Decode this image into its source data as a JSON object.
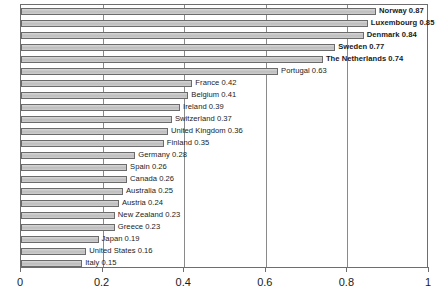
{
  "chart_data": {
    "type": "bar",
    "orientation": "horizontal",
    "title": "",
    "xlabel": "",
    "ylabel": "",
    "xlim": [
      0,
      1
    ],
    "grid": true,
    "legend": false,
    "xticks": [
      "0",
      "0.2",
      "0.4",
      "0.6",
      "0.8",
      "1"
    ],
    "xtick_values": [
      0,
      0.2,
      0.4,
      0.6,
      0.8,
      1
    ],
    "categories": [
      "Norway",
      "Luxembourg",
      "Denmark",
      "Sweden",
      "The Netherlands",
      "Portugal",
      "France",
      "Belgium",
      "Ireland",
      "Switzerland",
      "United Kingdom",
      "Finland",
      "Germany",
      "Spain",
      "Canada",
      "Australia",
      "Austria",
      "New Zealand",
      "Greece",
      "Japan",
      "United States",
      "Italy"
    ],
    "values": [
      0.87,
      0.85,
      0.84,
      0.77,
      0.74,
      0.63,
      0.42,
      0.41,
      0.39,
      0.37,
      0.36,
      0.35,
      0.28,
      0.26,
      0.26,
      0.25,
      0.24,
      0.23,
      0.23,
      0.19,
      0.16,
      0.15
    ],
    "data_labels": [
      "Norway 0.87",
      "Luxembourg 0.85",
      "Denmark 0.84",
      "Sweden 0.77",
      "The Netherlands 0.74",
      "Portugal 0.63",
      "France 0.42",
      "Belgium 0.41",
      "Ireland 0.39",
      "Switzerland 0.37",
      "United Kingdom 0.36",
      "Finland 0.35",
      "Germany 0.28",
      "Spain 0.26",
      "Canada 0.26",
      "Australia 0.25",
      "Austria 0.24",
      "New Zealand 0.23",
      "Greece 0.23",
      "Japan 0.19",
      "United States 0.16",
      "Italy 0.15"
    ],
    "emphasized": [
      true,
      true,
      true,
      true,
      true,
      false,
      false,
      false,
      false,
      false,
      false,
      false,
      false,
      false,
      false,
      false,
      false,
      false,
      false,
      false,
      false,
      false
    ],
    "colors": {
      "bar_fill": "#c3c3c3",
      "bar_border": "#6b6b6b",
      "gridline": "#8a8a8a",
      "axis": "#6e6e6e",
      "text": "#1a1a1a",
      "background": "#ffffff"
    }
  }
}
